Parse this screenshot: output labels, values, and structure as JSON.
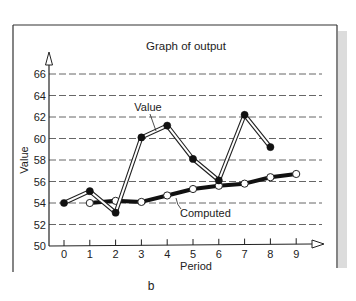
{
  "chart_data": {
    "type": "line",
    "title": "Graph of output",
    "xlabel": "Period",
    "ylabel": "Value",
    "caption": "b",
    "x": [
      0,
      1,
      2,
      3,
      4,
      5,
      6,
      7,
      8,
      9
    ],
    "xticks": [
      "0",
      "1",
      "2",
      "3",
      "4",
      "5",
      "6",
      "7",
      "8",
      "9"
    ],
    "yticks": [
      "50",
      "52",
      "54",
      "56",
      "58",
      "60",
      "62",
      "64",
      "66"
    ],
    "ylim": [
      50,
      67
    ],
    "xlim": [
      -0.6,
      10
    ],
    "grid": "horizontal dashed",
    "series": [
      {
        "name": "Value",
        "style": "double outline line, filled dots",
        "x": [
          0,
          1,
          2,
          3,
          4,
          5,
          6,
          7,
          8
        ],
        "values": [
          54.0,
          55.1,
          53.1,
          60.1,
          61.2,
          58.1,
          56.1,
          62.2,
          59.2
        ]
      },
      {
        "name": "Computed",
        "style": "thick solid line, open dots",
        "x": [
          1,
          2,
          3,
          4,
          5,
          6,
          7,
          8,
          9
        ],
        "values": [
          54.0,
          54.2,
          54.1,
          54.7,
          55.3,
          55.6,
          55.8,
          56.4,
          56.7
        ]
      }
    ],
    "annotations": [
      {
        "text": "Value",
        "target_series": "Value"
      },
      {
        "text": "Computed",
        "target_series": "Computed"
      }
    ]
  },
  "colors": {
    "ink": "#1a1a1a",
    "grid": "#555555",
    "frame": "#333333",
    "shadow": "#d9d9d9",
    "background": "#ffffff"
  }
}
